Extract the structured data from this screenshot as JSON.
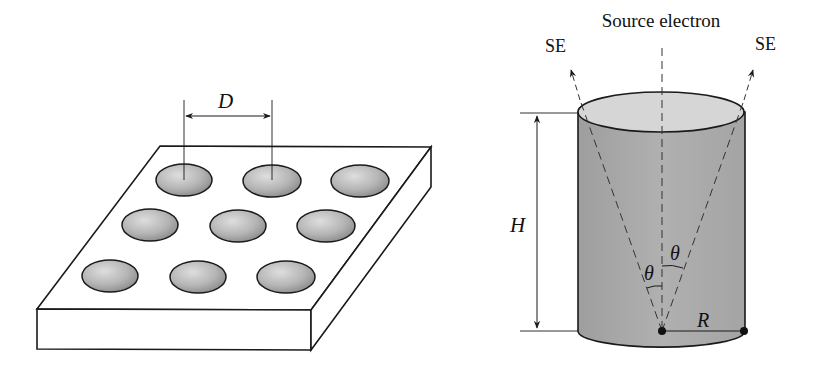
{
  "left_figure": {
    "title": "Hole array plate",
    "dimension_label": "D",
    "holes": {
      "rows": 3,
      "cols": 3
    }
  },
  "right_figure": {
    "source_label": "Source electron",
    "se_left_label": "SE",
    "se_right_label": "SE",
    "height_label": "H",
    "radius_label": "R",
    "angle_left_label": "θ",
    "angle_right_label": "θ"
  },
  "colors": {
    "stroke": "#1a1a1a",
    "hole_fill_light": "#d8d8d8",
    "hole_fill_dark": "#8a8a8a",
    "cylinder_fill": "#a9a9a9",
    "cylinder_top": "#d9d9d9"
  }
}
